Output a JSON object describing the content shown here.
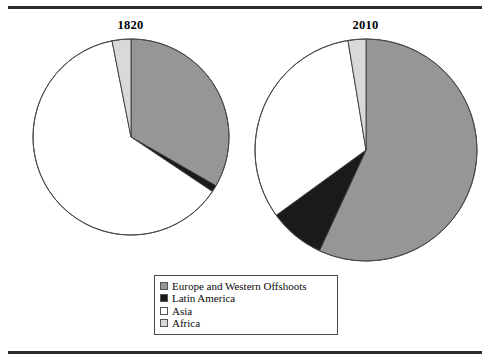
{
  "figure": {
    "top_rule": "horizontal-rule",
    "bottom_rule": "horizontal-rule"
  },
  "legend": {
    "position": "bottom-center",
    "items": [
      {
        "label": "Europe and Western Offshoots",
        "color": "#969696"
      },
      {
        "label": "Latin America",
        "color": "#1a1a1a"
      },
      {
        "label": "Asia",
        "color": "#ffffff"
      },
      {
        "label": "Africa",
        "color": "#d9d9d9"
      }
    ]
  },
  "chart_data": [
    {
      "type": "pie",
      "title": "1820",
      "categories": [
        "Europe and Western Offshoots",
        "Latin America",
        "Asia",
        "Africa"
      ],
      "values": [
        33.3,
        1.1,
        62.5,
        3.1
      ],
      "colors": [
        "#969696",
        "#1a1a1a",
        "#ffffff",
        "#d9d9d9"
      ],
      "start_angle_deg": 0,
      "direction": "clockwise",
      "units": "percent share",
      "xlabel": "",
      "ylabel": "",
      "grid": false
    },
    {
      "type": "pie",
      "title": "2010",
      "categories": [
        "Europe and Western Offshoots",
        "Latin America",
        "Asia",
        "Africa"
      ],
      "values": [
        56.9,
        8.1,
        32.4,
        2.6
      ],
      "colors": [
        "#969696",
        "#1a1a1a",
        "#ffffff",
        "#d9d9d9"
      ],
      "start_angle_deg": 0,
      "direction": "clockwise",
      "units": "percent share",
      "xlabel": "",
      "ylabel": "",
      "grid": false
    }
  ]
}
